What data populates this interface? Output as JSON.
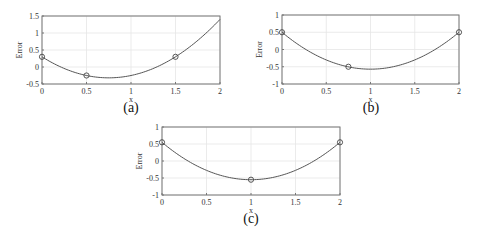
{
  "chart_data": [
    {
      "id": "a",
      "type": "line",
      "caption": "(a)",
      "xlabel": "x",
      "ylabel": "Error",
      "xlim": [
        0,
        2
      ],
      "ylim": [
        -0.5,
        1.5
      ],
      "xticks": [
        0,
        0.5,
        1,
        1.5,
        2
      ],
      "xtick_labels": [
        "0",
        "0.5",
        "1",
        "1.5",
        "2"
      ],
      "yticks": [
        -0.5,
        0,
        0.5,
        1,
        1.5
      ],
      "ytick_labels": [
        "-0.5",
        "0",
        "0.5",
        "1",
        "1.5"
      ],
      "grid": true,
      "curve": {
        "form": "quadratic",
        "coeffs": [
          1.1,
          -1.65,
          0.3
        ]
      },
      "markers": {
        "x": [
          0,
          0.5,
          1.5
        ],
        "y": [
          0.3,
          -0.25,
          0.3
        ]
      }
    },
    {
      "id": "b",
      "type": "line",
      "caption": "(b)",
      "xlabel": "x",
      "ylabel": "Error",
      "xlim": [
        0,
        2
      ],
      "ylim": [
        -1,
        1
      ],
      "xticks": [
        0,
        0.5,
        1,
        1.5,
        2
      ],
      "xtick_labels": [
        "0",
        "0.5",
        "1",
        "1.5",
        "2"
      ],
      "yticks": [
        -1,
        -0.5,
        0,
        0.5,
        1
      ],
      "ytick_labels": [
        "-1",
        "-0.5",
        "0",
        "0.5",
        "1"
      ],
      "grid": true,
      "curve": {
        "form": "quadratic",
        "coeffs": [
          1.07,
          -2.14,
          0.5
        ]
      },
      "markers": {
        "x": [
          0,
          0.75,
          2
        ],
        "y": [
          0.5,
          -0.5,
          0.5
        ]
      }
    },
    {
      "id": "c",
      "type": "line",
      "caption": "(c)",
      "xlabel": "x",
      "ylabel": "Error",
      "xlim": [
        0,
        2
      ],
      "ylim": [
        -1,
        1
      ],
      "xticks": [
        0,
        0.5,
        1,
        1.5,
        2
      ],
      "xtick_labels": [
        "0",
        "0.5",
        "1",
        "1.5",
        "2"
      ],
      "yticks": [
        -1,
        -0.5,
        0,
        0.5,
        1
      ],
      "ytick_labels": [
        "-1",
        "-0.5",
        "0",
        "0.5",
        "1"
      ],
      "grid": true,
      "curve": {
        "form": "quadratic",
        "coeffs": [
          1.1,
          -2.2,
          0.55
        ]
      },
      "markers": {
        "x": [
          0,
          1,
          2
        ],
        "y": [
          0.55,
          -0.55,
          0.55
        ]
      }
    }
  ],
  "style": {
    "axis_color": "#777777",
    "grid_color": "#e6e6e6",
    "curve_color": "#555555",
    "marker_color": "#444444"
  }
}
